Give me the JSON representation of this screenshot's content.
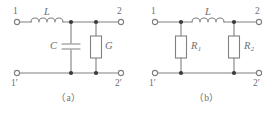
{
  "figure": {
    "background_color": "#ffffff",
    "line_color": "#808080",
    "label_color": "#6e6e6e",
    "node_color": "#3a3a3a",
    "panels": [
      {
        "id": "a",
        "caption": "（a）",
        "terminals": [
          {
            "name": "in-top",
            "label": "1",
            "position": "top-left"
          },
          {
            "name": "out-top",
            "label": "2",
            "position": "top-right"
          },
          {
            "name": "in-bottom",
            "label": "1′",
            "position": "bottom-left"
          },
          {
            "name": "out-bottom",
            "label": "2′",
            "position": "bottom-right"
          }
        ],
        "components": [
          {
            "name": "inductor",
            "type": "inductor",
            "label": "L",
            "subscript": "",
            "orientation": "horizontal",
            "branch": "series-top"
          },
          {
            "name": "capacitor",
            "type": "capacitor",
            "label": "C",
            "subscript": "",
            "orientation": "vertical",
            "branch": "shunt-left"
          },
          {
            "name": "conductance",
            "type": "resistor",
            "label": "G",
            "subscript": "",
            "orientation": "vertical",
            "branch": "shunt-right"
          }
        ],
        "nodes": 4
      },
      {
        "id": "b",
        "caption": "（b）",
        "terminals": [
          {
            "name": "in-top",
            "label": "1",
            "position": "top-left"
          },
          {
            "name": "out-top",
            "label": "2",
            "position": "top-right"
          },
          {
            "name": "in-bottom",
            "label": "1′",
            "position": "bottom-left"
          },
          {
            "name": "out-bottom",
            "label": "2′",
            "position": "bottom-right"
          }
        ],
        "components": [
          {
            "name": "inductor",
            "type": "inductor",
            "label": "L",
            "subscript": "",
            "orientation": "horizontal",
            "branch": "series-top"
          },
          {
            "name": "resistor-1",
            "type": "resistor",
            "label": "R",
            "subscript": "1",
            "orientation": "vertical",
            "branch": "shunt-left"
          },
          {
            "name": "resistor-2",
            "type": "resistor",
            "label": "R",
            "subscript": "2",
            "orientation": "vertical",
            "branch": "shunt-right"
          }
        ],
        "nodes": 4
      }
    ]
  }
}
